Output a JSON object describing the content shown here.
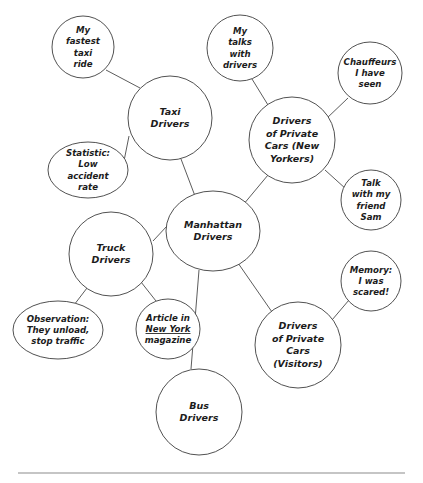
{
  "diagram": {
    "style": {
      "background": "#ffffff",
      "node_fill": "#ffffff",
      "node_stroke": "#3d3d3d",
      "link_stroke": "#4a4a4a",
      "text_color": "#1c1c1c",
      "rule_color": "#8c8c8c"
    },
    "nodes": [
      {
        "id": "manhattan-drivers",
        "kind": "center",
        "label": "Manhattan Drivers",
        "lines": [
          "Manhattan",
          "Drivers"
        ],
        "cx": 213,
        "cy": 231,
        "rx": 47,
        "ry": 40
      },
      {
        "id": "taxi-drivers",
        "kind": "branch",
        "label": "Taxi Drivers",
        "lines": [
          "Taxi",
          "Drivers"
        ],
        "cx": 170,
        "cy": 118,
        "rx": 42,
        "ry": 42
      },
      {
        "id": "drivers-private-cars-new-yorkers",
        "kind": "branch",
        "label": "Drivers of Private Cars (New Yorkers)",
        "lines": [
          "Drivers",
          "of Private",
          "Cars (New",
          "Yorkers)"
        ],
        "cx": 292,
        "cy": 140,
        "rx": 43,
        "ry": 43
      },
      {
        "id": "truck-drivers",
        "kind": "branch",
        "label": "Truck Drivers",
        "lines": [
          "Truck",
          "Drivers"
        ],
        "cx": 111,
        "cy": 254,
        "rx": 42,
        "ry": 42
      },
      {
        "id": "bus-drivers",
        "kind": "branch",
        "label": "Bus Drivers",
        "lines": [
          "Bus",
          "Drivers"
        ],
        "cx": 199,
        "cy": 412,
        "rx": 43,
        "ry": 43
      },
      {
        "id": "drivers-private-cars-visitors",
        "kind": "branch",
        "label": "Drivers of Private Cars (Visitors)",
        "lines": [
          "Drivers",
          "of Private",
          "Cars",
          "(Visitors)"
        ],
        "cx": 298,
        "cy": 345,
        "rx": 43,
        "ry": 43
      },
      {
        "id": "my-fastest-taxi-ride",
        "kind": "leaf",
        "label": "My fastest taxi ride",
        "lines": [
          "My",
          "fastest",
          "taxi",
          "ride"
        ],
        "cx": 83,
        "cy": 47,
        "rx": 31,
        "ry": 31
      },
      {
        "id": "statistic-low-accident-rate",
        "kind": "leaf",
        "label": "Statistic: Low accident rate",
        "lines": [
          "Statistic:",
          "Low",
          "accident",
          "rate"
        ],
        "cx": 88,
        "cy": 170,
        "rx": 40,
        "ry": 28
      },
      {
        "id": "my-talks-with-drivers",
        "kind": "leaf",
        "label": "My talks with drivers",
        "lines": [
          "My",
          "talks",
          "with",
          "drivers"
        ],
        "cx": 240,
        "cy": 48,
        "rx": 33,
        "ry": 33
      },
      {
        "id": "chauffeurs-i-have-seen",
        "kind": "leaf",
        "label": "Chauffeurs I have seen",
        "lines": [
          "Chauffeurs",
          "I have",
          "seen"
        ],
        "cx": 370,
        "cy": 73,
        "rx": 32,
        "ry": 31
      },
      {
        "id": "talk-with-my-friend-sam",
        "kind": "leaf",
        "label": "Talk with my friend Sam",
        "lines": [
          "Talk",
          "with my",
          "friend",
          "Sam"
        ],
        "cx": 371,
        "cy": 200,
        "rx": 30,
        "ry": 30
      },
      {
        "id": "memory-i-was-scared",
        "kind": "leaf",
        "label": "Memory: I was scared!",
        "lines": [
          "Memory:",
          "I was",
          "scared!"
        ],
        "cx": 371,
        "cy": 281,
        "rx": 30,
        "ry": 30
      },
      {
        "id": "observation-they-unload-stop-traffic",
        "kind": "leaf",
        "label": "Observation: They unload, stop traffic",
        "lines": [
          "Observation:",
          "They unload,",
          "stop traffic"
        ],
        "cx": 58,
        "cy": 330,
        "rx": 45,
        "ry": 29
      },
      {
        "id": "article-in-new-york-magazine",
        "kind": "leaf",
        "label": "Article in New York magazine",
        "lines": [
          "Article in",
          "New York",
          "magazine"
        ],
        "underline_line": 1,
        "cx": 168,
        "cy": 329,
        "rx": 32,
        "ry": 30
      }
    ],
    "links": [
      {
        "id": "link-center-taxi",
        "from": "manhattan-drivers",
        "to": "taxi-drivers",
        "x1": 195,
        "y1": 196,
        "x2": 181,
        "y2": 159
      },
      {
        "id": "link-center-private-ny",
        "from": "manhattan-drivers",
        "to": "drivers-private-cars-new-yorkers",
        "x1": 243,
        "y1": 205,
        "x2": 268,
        "y2": 175
      },
      {
        "id": "link-center-truck",
        "from": "manhattan-drivers",
        "to": "truck-drivers",
        "x1": 167,
        "y1": 226,
        "x2": 153,
        "y2": 241
      },
      {
        "id": "link-center-bus",
        "from": "manhattan-drivers",
        "to": "bus-drivers",
        "x1": 199,
        "y1": 270,
        "x2": 191,
        "y2": 369
      },
      {
        "id": "link-center-private-visitors",
        "from": "manhattan-drivers",
        "to": "drivers-private-cars-visitors",
        "x1": 238,
        "y1": 263,
        "x2": 272,
        "y2": 312
      },
      {
        "id": "link-taxi-fastest-ride",
        "from": "taxi-drivers",
        "to": "my-fastest-taxi-ride",
        "x1": 140,
        "y1": 88,
        "x2": 106,
        "y2": 70
      },
      {
        "id": "link-taxi-statistic",
        "from": "taxi-drivers",
        "to": "statistic-low-accident-rate",
        "x1": 129,
        "y1": 136,
        "x2": 124,
        "y2": 161
      },
      {
        "id": "link-private-ny-talks",
        "from": "drivers-private-cars-new-yorkers",
        "to": "my-talks-with-drivers",
        "x1": 268,
        "y1": 105,
        "x2": 252,
        "y2": 79
      },
      {
        "id": "link-private-ny-chauffeurs",
        "from": "drivers-private-cars-new-yorkers",
        "to": "chauffeurs-i-have-seen",
        "x1": 326,
        "y1": 119,
        "x2": 348,
        "y2": 98
      },
      {
        "id": "link-private-ny-sam",
        "from": "drivers-private-cars-new-yorkers",
        "to": "talk-with-my-friend-sam",
        "x1": 325,
        "y1": 170,
        "x2": 346,
        "y2": 189
      },
      {
        "id": "link-truck-observation",
        "from": "truck-drivers",
        "to": "observation-they-unload-stop-traffic",
        "x1": 87,
        "y1": 288,
        "x2": 74,
        "y2": 305
      },
      {
        "id": "link-truck-article",
        "from": "truck-drivers",
        "to": "article-in-new-york-magazine",
        "x1": 141,
        "y1": 282,
        "x2": 156,
        "y2": 301
      },
      {
        "id": "link-visitors-memory",
        "from": "drivers-private-cars-visitors",
        "to": "memory-i-was-scared",
        "x1": 332,
        "y1": 320,
        "x2": 349,
        "y2": 300
      }
    ],
    "footer_rule": {
      "id": "footer-rule",
      "x1": 18,
      "y1": 473,
      "x2": 405,
      "y2": 473
    }
  }
}
